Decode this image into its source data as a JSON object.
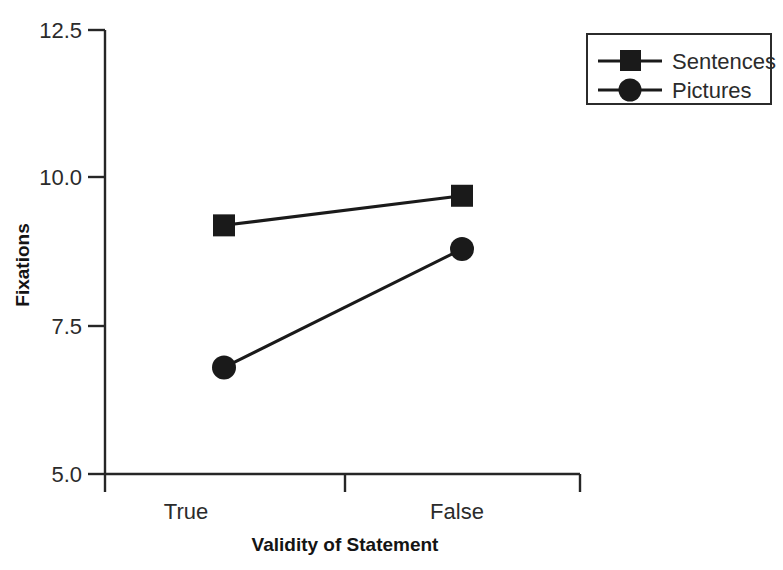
{
  "chart_data": {
    "type": "line",
    "title": "",
    "xlabel": "Validity of Statement",
    "ylabel": "Fixations",
    "categories": [
      "True",
      "False"
    ],
    "ylim": [
      5.0,
      12.5
    ],
    "yticks": [
      5.0,
      7.5,
      10.0,
      12.5
    ],
    "ytick_labels": [
      "5.0",
      "7.5",
      "10.0",
      "12.5"
    ],
    "grid": false,
    "legend_position": "top-right",
    "series": [
      {
        "name": "Sentences",
        "marker": "square",
        "color": "#1a1a1a",
        "values": [
          9.2,
          9.7
        ]
      },
      {
        "name": "Pictures",
        "marker": "circle",
        "color": "#1a1a1a",
        "values": [
          6.8,
          8.8
        ]
      }
    ]
  },
  "axes": {
    "y_tick_0": "5.0",
    "y_tick_1": "7.5",
    "y_tick_2": "10.0",
    "y_tick_3": "12.5",
    "x_tick_0": "True",
    "x_tick_1": "False",
    "x_axis_title": "Validity of Statement",
    "y_axis_title": "Fixations"
  },
  "legend": {
    "items": [
      {
        "label": "Sentences",
        "marker": "square-marker"
      },
      {
        "label": "Pictures",
        "marker": "circle-marker"
      }
    ]
  }
}
